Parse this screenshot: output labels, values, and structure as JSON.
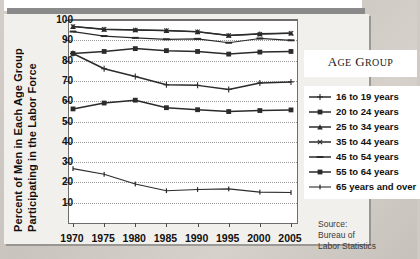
{
  "axis_title_line1": "Percent of Men in Each Age Group",
  "axis_title_line2": "Participating in the Labor Force",
  "legend": {
    "title_big": "A",
    "title": "AGE GROUP",
    "title_word1_cap": "A",
    "title_word1_rest": "GE",
    "title_word2_cap": "G",
    "title_word2_rest": "ROUP"
  },
  "source": {
    "line1": "Source:",
    "line2": "Bureau of",
    "line3": "Labor Statistics"
  },
  "chart_data": {
    "type": "line",
    "title": "",
    "xlabel": "",
    "ylabel": "Percent of Men in Each Age Group Participating in the Labor Force",
    "x": [
      1970,
      1975,
      1980,
      1985,
      1990,
      1995,
      2000,
      2005
    ],
    "xticklabels": [
      "1970",
      "1975",
      "1980",
      "1985",
      "1990",
      "1995",
      "2000",
      "2005"
    ],
    "yticklabels": [
      "100",
      "90",
      "80",
      "70",
      "60",
      "50",
      "40",
      "30",
      "20",
      "10"
    ],
    "ylim": [
      0,
      100
    ],
    "xlim": [
      1970,
      2005
    ],
    "grid": true,
    "legend_position": "right",
    "legend_entries": [
      "16 to 19 years",
      "20 to 24 years",
      "25 to 34 years",
      "35 to 44 years",
      "45 to 54 years",
      "55 to 64 years",
      "65 years and over"
    ],
    "series": [
      {
        "name": "16 to 19 years",
        "marker": "plus",
        "values": [
          83.5,
          76.0,
          72.2,
          68.1,
          67.8,
          65.8,
          69.0,
          69.5
        ]
      },
      {
        "name": "20 to 24 years",
        "marker": "square",
        "values": [
          83.5,
          84.5,
          85.9,
          84.9,
          84.5,
          83.2,
          84.2,
          84.5
        ]
      },
      {
        "name": "25 to 34 years",
        "marker": "triangle",
        "values": [
          96.8,
          95.4,
          95.1,
          94.8,
          94.2,
          92.4,
          93.2,
          93.5
        ]
      },
      {
        "name": "35 to 44 years",
        "marker": "cross",
        "values": [
          96.8,
          95.4,
          95.1,
          94.8,
          94.2,
          92.4,
          93.0,
          93.5
        ]
      },
      {
        "name": "45 to 54 years",
        "marker": "dash",
        "values": [
          94.3,
          92.1,
          91.2,
          90.5,
          90.7,
          88.8,
          90.9,
          90.0
        ]
      },
      {
        "name": "55 to 64 years",
        "marker": "square",
        "values": [
          56.2,
          59.1,
          60.5,
          56.8,
          55.8,
          54.9,
          55.4,
          55.7
        ]
      },
      {
        "name": "65 years and over",
        "marker": "line",
        "values": [
          26.8,
          24.0,
          19.2,
          15.9,
          16.5,
          16.8,
          15.2,
          15.0
        ]
      }
    ]
  }
}
